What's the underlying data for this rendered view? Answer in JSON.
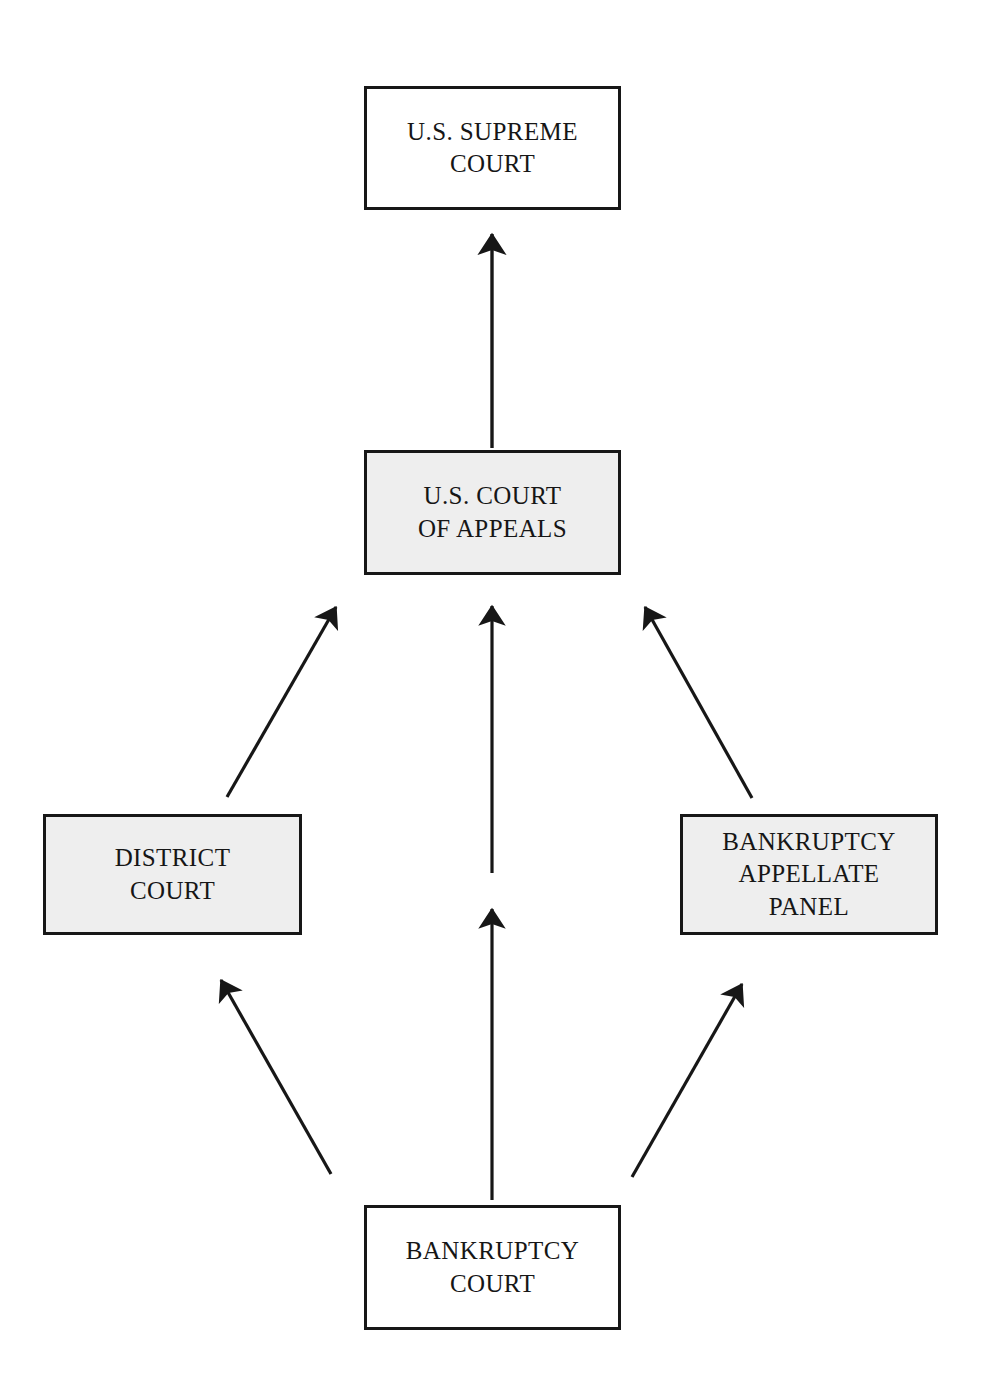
{
  "diagram": {
    "type": "flow-hierarchy",
    "canvas": {
      "width": 991,
      "height": 1394,
      "background": "#ffffff"
    },
    "colors": {
      "box_border": "#171717",
      "box_fill_white": "#ffffff",
      "box_fill_gray": "#eeeeee",
      "arrow": "#171717",
      "text": "#161616"
    },
    "nodes": [
      {
        "id": "supreme-court",
        "label": "U.S. SUPREME\nCOURT",
        "fill": "#ffffff",
        "x": 364,
        "y": 86,
        "width": 257,
        "height": 124
      },
      {
        "id": "court-of-appeals",
        "label": "U.S. COURT\nOF APPEALS",
        "fill": "#eeeeee",
        "x": 364,
        "y": 450,
        "width": 257,
        "height": 125
      },
      {
        "id": "district-court",
        "label": "DISTRICT\nCOURT",
        "fill": "#eeeeee",
        "x": 43,
        "y": 814,
        "width": 259,
        "height": 121
      },
      {
        "id": "bankruptcy-appellate-panel",
        "label": "BANKRUPTCY\nAPPELLATE\nPANEL",
        "fill": "#eeeeee",
        "x": 680,
        "y": 814,
        "width": 258,
        "height": 121
      },
      {
        "id": "bankruptcy-court",
        "label": "BANKRUPTCY\nCOURT",
        "fill": "#ffffff",
        "x": 364,
        "y": 1205,
        "width": 257,
        "height": 125
      }
    ],
    "edges": [
      {
        "id": "appeals-to-supreme",
        "from": "court-of-appeals",
        "to": "supreme-court",
        "x1": 492,
        "y1": 448,
        "x2": 492,
        "y2": 228
      },
      {
        "id": "district-to-appeals",
        "from": "district-court",
        "to": "court-of-appeals",
        "x1": 227,
        "y1": 797,
        "x2": 340,
        "y2": 602
      },
      {
        "id": "middle-to-appeals",
        "from": "bankruptcy-court",
        "to": "court-of-appeals",
        "x1": 492,
        "y1": 873,
        "x2": 492,
        "y2": 600
      },
      {
        "id": "bap-to-appeals",
        "from": "bankruptcy-appellate-panel",
        "to": "court-of-appeals",
        "x1": 752,
        "y1": 798,
        "x2": 641,
        "y2": 602
      },
      {
        "id": "bankruptcy-to-district",
        "from": "bankruptcy-court",
        "to": "district-court",
        "x1": 331,
        "y1": 1174,
        "x2": 217,
        "y2": 973
      },
      {
        "id": "bankruptcy-to-middle",
        "from": "bankruptcy-court",
        "to": "court-of-appeals",
        "x1": 492,
        "y1": 1200,
        "x2": 492,
        "y2": 903
      },
      {
        "id": "bankruptcy-to-bap",
        "from": "bankruptcy-court",
        "to": "bankruptcy-appellate-panel",
        "x1": 632,
        "y1": 1177,
        "x2": 746,
        "y2": 977
      }
    ]
  }
}
